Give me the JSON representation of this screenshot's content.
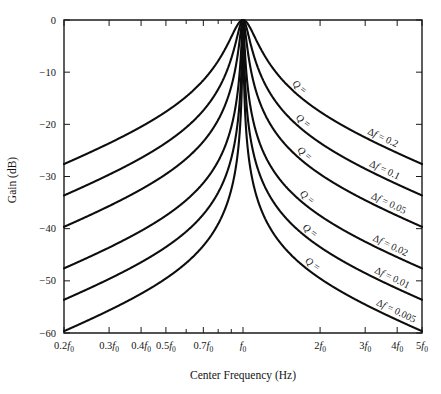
{
  "chart_data": {
    "type": "line",
    "title": "",
    "xlabel": "Center Frequency (Hz)",
    "ylabel": "Gain (dB)",
    "xscale": "log",
    "xlim": [
      0.2,
      5
    ],
    "ylim": [
      -60,
      0
    ],
    "grid": false,
    "legend_position": "inline-annotations",
    "x_tick_labels": [
      "0.2f0",
      "0.3f0",
      "0.4f0",
      "0.5f0",
      "0.7f0",
      "f0",
      "2f0",
      "3f0",
      "4f0",
      "5f0"
    ],
    "x_tick_values": [
      0.2,
      0.3,
      0.4,
      0.5,
      0.7,
      1,
      2,
      3,
      4,
      5
    ],
    "x_tick_mantissas": [
      "0.2",
      "0.3",
      "0.4",
      "0.5",
      "0.7",
      "",
      "2",
      "3",
      "4",
      "5"
    ],
    "y_tick_labels": [
      "0",
      "−10",
      "−20",
      "−30",
      "−40",
      "−50",
      "−60"
    ],
    "y_tick_values": [
      0,
      -10,
      -20,
      -30,
      -40,
      -50,
      -60
    ],
    "formula": "20*log10(1/sqrt(1+Q^2*(f/f0 - f0/f)^2))",
    "series": [
      {
        "name": "Q = 5",
        "Q": 5,
        "delta_f": 0.2,
        "label": "Q = 5",
        "delta_label": "Δf = 0.2",
        "gain_at_0p2f0": -28.0,
        "gain_at_5f0": -28.0,
        "gain_at_f0": 0
      },
      {
        "name": "Q = 10",
        "Q": 10,
        "delta_f": 0.1,
        "label": "Q = 10",
        "delta_label": "Δf = 0.1",
        "gain_at_0p2f0": -34.0,
        "gain_at_5f0": -34.0,
        "gain_at_f0": 0
      },
      {
        "name": "Q = 20",
        "Q": 20,
        "delta_f": 0.05,
        "label": "Q = 20",
        "delta_label": "Δf = 0.05",
        "gain_at_0p2f0": -40.0,
        "gain_at_5f0": -40.0,
        "gain_at_f0": 0
      },
      {
        "name": "Q = 50",
        "Q": 50,
        "delta_f": 0.02,
        "label": "Q = 50",
        "delta_label": "Δf = 0.02",
        "gain_at_0p2f0": -47.9,
        "gain_at_5f0": -47.9,
        "gain_at_f0": 0
      },
      {
        "name": "Q = 100",
        "Q": 100,
        "delta_f": 0.01,
        "label": "Q = 100",
        "delta_label": "Δf = 0.01",
        "gain_at_0p2f0": -53.9,
        "gain_at_5f0": -53.9,
        "gain_at_f0": 0
      },
      {
        "name": "Q = 200",
        "Q": 200,
        "delta_f": 0.005,
        "label": "Q = 200",
        "delta_label": "Δf = 0.005",
        "gain_at_0p2f0": -60.0,
        "gain_at_5f0": -60.0,
        "gain_at_f0": 0
      }
    ],
    "colors": {
      "curve": "#0d0d0d",
      "axis": "#1a1a1a",
      "background": "#ffffff"
    }
  }
}
